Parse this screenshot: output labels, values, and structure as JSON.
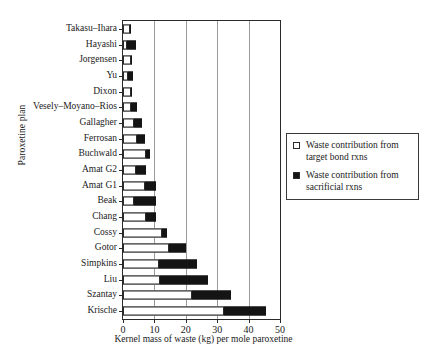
{
  "chart_data": {
    "type": "bar",
    "orientation": "horizontal",
    "stacked": true,
    "title": "",
    "xlabel": "Kernel mass of waste (kg) per mole paroxetine",
    "ylabel": "Paroxetine plan",
    "xlim": [
      0,
      50
    ],
    "xticks": [
      0,
      10,
      20,
      30,
      40,
      50
    ],
    "xtick_labels": [
      "0",
      "10",
      "20",
      "30",
      "40",
      "50"
    ],
    "grid": "vertical",
    "legend_position": "right",
    "categories": [
      "Takasu–Ihara",
      "Hayashi",
      "Jorgensen",
      "Yu",
      "Dixon",
      "Vesely–Moyano–Rios",
      "Gallagher",
      "Ferrosan",
      "Buchwald",
      "Amat G2",
      "Amat G1",
      "Beak",
      "Chang",
      "Cossy",
      "Gotor",
      "Simpkins",
      "Liu",
      "Szantay",
      "Krische"
    ],
    "series": [
      {
        "name": "Waste contribution from target bond rxns",
        "style": "hollow",
        "color": "#ffffff",
        "values": [
          2.2,
          1.2,
          2.6,
          1.5,
          2.6,
          2.4,
          3.5,
          4.4,
          7.3,
          4.2,
          7.0,
          3.6,
          7.4,
          12.5,
          14.6,
          11.5,
          11.8,
          22.0,
          32.2
        ]
      },
      {
        "name": "Waste contribution from sacrificial rxns",
        "style": "filled",
        "color": "#141414",
        "values": [
          0.3,
          3.0,
          0.3,
          1.7,
          0.3,
          2.2,
          2.5,
          2.6,
          1.2,
          3.0,
          3.6,
          7.0,
          3.2,
          1.6,
          5.6,
          12.0,
          15.4,
          12.4,
          13.4
        ]
      }
    ],
    "totals": [
      2.5,
      4.2,
      2.9,
      3.2,
      2.9,
      4.6,
      6.0,
      7.0,
      8.5,
      7.2,
      10.6,
      10.6,
      10.6,
      14.1,
      20.2,
      23.5,
      27.2,
      34.4,
      45.6
    ]
  },
  "legend": {
    "entries": [
      {
        "swatch": "hollow",
        "label_line1": "Waste contribution from",
        "label_line2": "target bond rxns"
      },
      {
        "swatch": "filled",
        "label_line1": "Waste contribution from",
        "label_line2": "sacrificial rxns"
      }
    ]
  }
}
